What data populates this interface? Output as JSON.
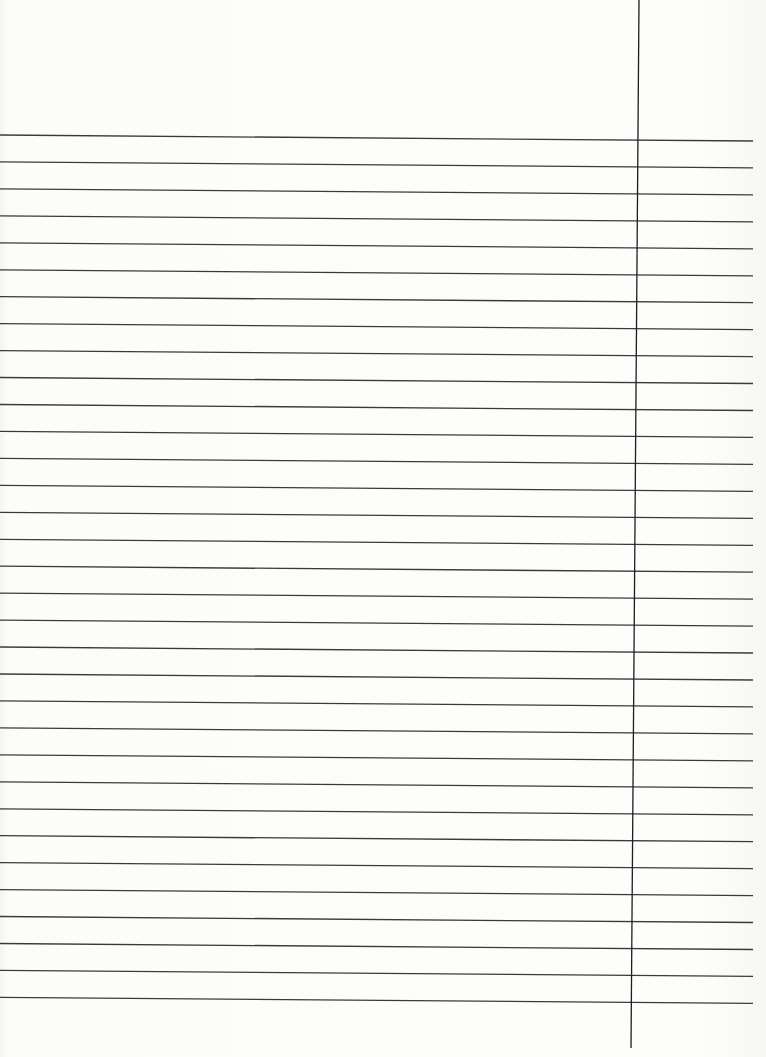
{
  "page": {
    "type": "ruled-notebook-paper",
    "text": "",
    "ruled_line_count": 33,
    "first_line_y": 135,
    "line_spacing_px": 26.95,
    "line_start_x": 0,
    "line_end_x": 753,
    "skew_px_across_width": 6,
    "margin_line": {
      "x_top": 639,
      "x_bottom": 631,
      "y_top": 0,
      "y_bottom": 1048
    },
    "colors": {
      "paper": "#fbfbfa",
      "rule_line": "#3a3a3a",
      "margin_line": "#1e1e1e"
    }
  }
}
